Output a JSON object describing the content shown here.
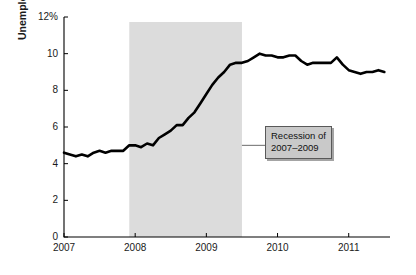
{
  "chart_data": {
    "type": "line",
    "title": "",
    "subtitle": "",
    "xlabel": "",
    "ylabel": "Unemployment rate",
    "xlim": [
      2007.0,
      2011.58
    ],
    "ylim": [
      0,
      12
    ],
    "grid": false,
    "legend_position": "none",
    "y_tick_labels": [
      "12%",
      "10",
      "8",
      "6",
      "4",
      "2",
      "0"
    ],
    "y_ticks": [
      12,
      10,
      8,
      6,
      4,
      2,
      0
    ],
    "x_tick_labels": [
      "2007",
      "2008",
      "2009",
      "2010",
      "2011"
    ],
    "x_ticks": [
      2007,
      2008,
      2009,
      2010,
      2011
    ],
    "series": [
      {
        "name": "Unemployment rate",
        "color": "#000000",
        "units": "percent",
        "x": [
          2007.0,
          2007.083,
          2007.167,
          2007.25,
          2007.333,
          2007.417,
          2007.5,
          2007.583,
          2007.667,
          2007.75,
          2007.833,
          2007.917,
          2008.0,
          2008.083,
          2008.167,
          2008.25,
          2008.333,
          2008.417,
          2008.5,
          2008.583,
          2008.667,
          2008.75,
          2008.833,
          2008.917,
          2009.0,
          2009.083,
          2009.167,
          2009.25,
          2009.333,
          2009.417,
          2009.5,
          2009.583,
          2009.667,
          2009.75,
          2009.833,
          2009.917,
          2010.0,
          2010.083,
          2010.167,
          2010.25,
          2010.333,
          2010.417,
          2010.5,
          2010.583,
          2010.667,
          2010.75,
          2010.833,
          2010.917,
          2011.0,
          2011.083,
          2011.167,
          2011.25,
          2011.333,
          2011.417,
          2011.5
        ],
        "values": [
          4.6,
          4.5,
          4.4,
          4.5,
          4.4,
          4.6,
          4.7,
          4.6,
          4.7,
          4.7,
          4.7,
          5.0,
          5.0,
          4.9,
          5.1,
          5.0,
          5.4,
          5.6,
          5.8,
          6.1,
          6.1,
          6.5,
          6.8,
          7.3,
          7.8,
          8.3,
          8.7,
          9.0,
          9.4,
          9.5,
          9.5,
          9.6,
          9.8,
          10.0,
          9.9,
          9.9,
          9.8,
          9.8,
          9.9,
          9.9,
          9.6,
          9.4,
          9.5,
          9.5,
          9.5,
          9.5,
          9.8,
          9.4,
          9.1,
          9.0,
          8.9,
          9.0,
          9.0,
          9.1,
          9.0
        ]
      }
    ],
    "shaded_regions": [
      {
        "name": "recession-band",
        "x_start": 2007.917,
        "x_end": 2009.5,
        "color": "#dcdcdc"
      }
    ],
    "annotations": [
      {
        "name": "recession-callout",
        "line1": "Recession of",
        "line2": "2007–2009",
        "box_fill": "#c9c9c9",
        "box_border": "#595959",
        "leader_from_x": 2009.5,
        "leader_from_y": 5.0
      }
    ]
  },
  "axis": {
    "line_color": "#000000",
    "tick_color": "#000000"
  }
}
